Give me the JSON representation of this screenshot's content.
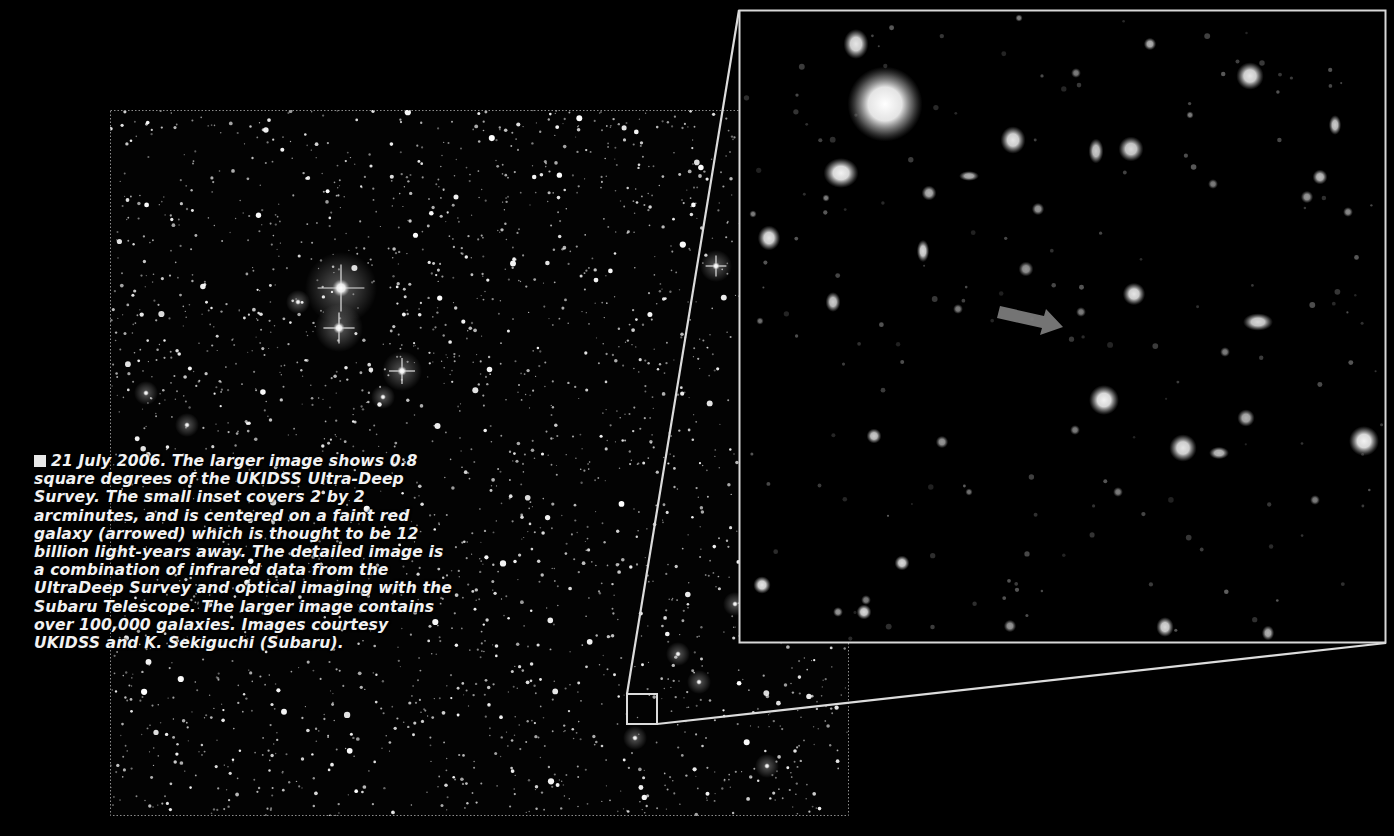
{
  "caption": {
    "bullet": "square-bullet-icon",
    "date": "21 July 2006.",
    "text": "The larger image shows 0.8 square degrees of the UKIDSS Ultra-Deep Survey. The small inset covers 2 by 2 arcminutes, and is centered on a faint red galaxy (arrowed) which is thought to be 12 billion light-years away. The detailed image is a combination of infrared data from the UltraDeep Survey and optical imaging with the Subaru Telescope. The larger image contains over 100,000 galaxies. Images courtesy UKIDSS and K. Sekiguchi (Subaru)."
  },
  "wide_field": {
    "description": "UKIDSS Ultra-Deep Survey wide field, 0.8 square degrees",
    "bounds": {
      "x": 110,
      "y": 110,
      "w": 739,
      "h": 706
    },
    "border_color": "#9a9a9a",
    "bright_stars": [
      {
        "x": 341,
        "y": 288,
        "r": 9,
        "spikes": true
      },
      {
        "x": 339,
        "y": 328,
        "r": 6,
        "spikes": true
      },
      {
        "x": 402,
        "y": 371,
        "r": 5,
        "spikes": true
      },
      {
        "x": 716,
        "y": 266,
        "r": 4,
        "spikes": true
      },
      {
        "x": 383,
        "y": 397,
        "r": 3,
        "spikes": false
      },
      {
        "x": 298,
        "y": 302,
        "r": 3,
        "spikes": false
      },
      {
        "x": 735,
        "y": 604,
        "r": 3,
        "spikes": false
      },
      {
        "x": 767,
        "y": 766,
        "r": 3,
        "spikes": false
      },
      {
        "x": 635,
        "y": 738,
        "r": 3,
        "spikes": false
      },
      {
        "x": 678,
        "y": 654,
        "r": 3,
        "spikes": false
      },
      {
        "x": 699,
        "y": 682,
        "r": 3,
        "spikes": false
      },
      {
        "x": 187,
        "y": 425,
        "r": 3,
        "spikes": false
      },
      {
        "x": 146,
        "y": 393,
        "r": 3,
        "spikes": false
      }
    ]
  },
  "inset_marker": {
    "x": 627,
    "y": 694,
    "w": 30,
    "h": 30,
    "color": "#dcdcdc"
  },
  "zoom_inset": {
    "description": "2 by 2 arcminute detail centered on faint red galaxy",
    "bounds": {
      "x": 739,
      "y": 10,
      "w": 647,
      "h": 633
    },
    "border_color": "#d8d8d8",
    "arrow": {
      "x1": 998,
      "y1": 313,
      "x2": 1062,
      "y2": 330,
      "color": "#7a7a7a",
      "label": "arrow-pointing-to-faint-red-galaxy"
    },
    "galaxies": [
      {
        "x": 885,
        "y": 104,
        "rx": 30,
        "ry": 30,
        "b": 1.0
      },
      {
        "x": 856,
        "y": 44,
        "rx": 10,
        "ry": 12,
        "b": 0.9
      },
      {
        "x": 841,
        "y": 173,
        "rx": 14,
        "ry": 12,
        "b": 0.95
      },
      {
        "x": 1013,
        "y": 140,
        "rx": 10,
        "ry": 11,
        "b": 0.9
      },
      {
        "x": 1131,
        "y": 149,
        "rx": 10,
        "ry": 10,
        "b": 0.85
      },
      {
        "x": 1096,
        "y": 151,
        "rx": 6,
        "ry": 10,
        "b": 0.8
      },
      {
        "x": 1150,
        "y": 44,
        "rx": 5,
        "ry": 5,
        "b": 0.7
      },
      {
        "x": 1250,
        "y": 76,
        "rx": 11,
        "ry": 11,
        "b": 0.9
      },
      {
        "x": 1335,
        "y": 125,
        "rx": 5,
        "ry": 8,
        "b": 0.8
      },
      {
        "x": 1320,
        "y": 177,
        "rx": 6,
        "ry": 6,
        "b": 0.75
      },
      {
        "x": 1307,
        "y": 197,
        "rx": 5,
        "ry": 5,
        "b": 0.6
      },
      {
        "x": 969,
        "y": 176,
        "rx": 8,
        "ry": 4,
        "b": 0.7
      },
      {
        "x": 929,
        "y": 193,
        "rx": 6,
        "ry": 6,
        "b": 0.7
      },
      {
        "x": 1038,
        "y": 209,
        "rx": 5,
        "ry": 5,
        "b": 0.6
      },
      {
        "x": 1026,
        "y": 269,
        "rx": 6,
        "ry": 6,
        "b": 0.6
      },
      {
        "x": 769,
        "y": 238,
        "rx": 9,
        "ry": 10,
        "b": 0.9
      },
      {
        "x": 923,
        "y": 251,
        "rx": 5,
        "ry": 9,
        "b": 0.85
      },
      {
        "x": 833,
        "y": 302,
        "rx": 6,
        "ry": 8,
        "b": 0.8
      },
      {
        "x": 1134,
        "y": 294,
        "rx": 9,
        "ry": 9,
        "b": 0.9
      },
      {
        "x": 1258,
        "y": 322,
        "rx": 12,
        "ry": 7,
        "b": 0.85
      },
      {
        "x": 1104,
        "y": 400,
        "rx": 12,
        "ry": 12,
        "b": 0.95
      },
      {
        "x": 1183,
        "y": 448,
        "rx": 11,
        "ry": 11,
        "b": 0.9
      },
      {
        "x": 1219,
        "y": 453,
        "rx": 8,
        "ry": 5,
        "b": 0.75
      },
      {
        "x": 1246,
        "y": 418,
        "rx": 7,
        "ry": 7,
        "b": 0.7
      },
      {
        "x": 1364,
        "y": 441,
        "rx": 12,
        "ry": 12,
        "b": 0.95
      },
      {
        "x": 942,
        "y": 442,
        "rx": 5,
        "ry": 5,
        "b": 0.6
      },
      {
        "x": 874,
        "y": 436,
        "rx": 6,
        "ry": 6,
        "b": 0.8
      },
      {
        "x": 902,
        "y": 563,
        "rx": 6,
        "ry": 6,
        "b": 0.85
      },
      {
        "x": 762,
        "y": 585,
        "rx": 7,
        "ry": 7,
        "b": 0.9
      },
      {
        "x": 838,
        "y": 612,
        "rx": 4,
        "ry": 4,
        "b": 0.6
      },
      {
        "x": 864,
        "y": 612,
        "rx": 6,
        "ry": 6,
        "b": 0.85
      },
      {
        "x": 866,
        "y": 600,
        "rx": 4,
        "ry": 4,
        "b": 0.5
      },
      {
        "x": 1010,
        "y": 626,
        "rx": 5,
        "ry": 5,
        "b": 0.6
      },
      {
        "x": 1165,
        "y": 627,
        "rx": 7,
        "ry": 8,
        "b": 0.85
      },
      {
        "x": 1075,
        "y": 430,
        "rx": 4,
        "ry": 4,
        "b": 0.5
      },
      {
        "x": 1118,
        "y": 492,
        "rx": 4,
        "ry": 4,
        "b": 0.5
      },
      {
        "x": 1268,
        "y": 633,
        "rx": 5,
        "ry": 6,
        "b": 0.7
      },
      {
        "x": 1315,
        "y": 500,
        "rx": 4,
        "ry": 4,
        "b": 0.5
      },
      {
        "x": 1225,
        "y": 352,
        "rx": 4,
        "ry": 4,
        "b": 0.5
      },
      {
        "x": 1081,
        "y": 312,
        "rx": 4,
        "ry": 4,
        "b": 0.5
      },
      {
        "x": 958,
        "y": 309,
        "rx": 4,
        "ry": 4,
        "b": 0.5
      },
      {
        "x": 1348,
        "y": 212,
        "rx": 4,
        "ry": 4,
        "b": 0.55
      },
      {
        "x": 826,
        "y": 198,
        "rx": 3,
        "ry": 3,
        "b": 0.5
      },
      {
        "x": 753,
        "y": 214,
        "rx": 3,
        "ry": 3,
        "b": 0.5
      },
      {
        "x": 1213,
        "y": 184,
        "rx": 4,
        "ry": 4,
        "b": 0.5
      },
      {
        "x": 1190,
        "y": 115,
        "rx": 3,
        "ry": 3,
        "b": 0.5
      },
      {
        "x": 1076,
        "y": 73,
        "rx": 4,
        "ry": 4,
        "b": 0.5
      },
      {
        "x": 1019,
        "y": 18,
        "rx": 3,
        "ry": 3,
        "b": 0.5
      },
      {
        "x": 760,
        "y": 321,
        "rx": 3,
        "ry": 3,
        "b": 0.45
      },
      {
        "x": 969,
        "y": 492,
        "rx": 3,
        "ry": 3,
        "b": 0.45
      }
    ]
  }
}
